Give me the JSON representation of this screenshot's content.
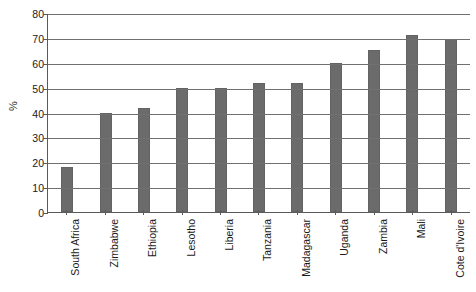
{
  "chart_data": {
    "type": "bar",
    "title": "",
    "xlabel": "",
    "ylabel": "%",
    "ylim": [
      0,
      80
    ],
    "ytick_step": 10,
    "yticks": [
      80,
      70,
      60,
      50,
      40,
      30,
      20,
      10,
      0
    ],
    "grid": true,
    "legend": "none",
    "bar_color": "#6b6b6b",
    "axis_color": "#5a5a5a",
    "gridline_color": "#707070",
    "categories": [
      "South Africa",
      "Zimbabwe",
      "Ethiopia",
      "Lesotho",
      "Liberia",
      "Tanzania",
      "Madagascar",
      "Uganda",
      "Zambia",
      "Mali",
      "Cote d'Ivoire"
    ],
    "values": [
      18,
      40,
      42,
      50,
      50,
      52,
      52,
      60,
      65,
      71,
      69.5
    ]
  }
}
